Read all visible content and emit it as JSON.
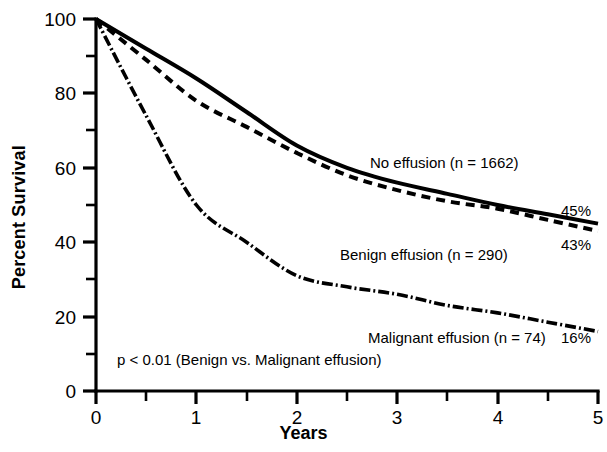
{
  "chart_data": {
    "type": "line",
    "title": "",
    "xlabel": "Years",
    "ylabel": "Percent Survival",
    "xlim": [
      0,
      5
    ],
    "ylim": [
      0,
      100
    ],
    "x_ticks": [
      "0",
      "1",
      "2",
      "3",
      "4",
      "5"
    ],
    "x_tick_values": [
      0,
      1,
      2,
      3,
      4,
      5
    ],
    "x_minor_ticks": [
      0.5,
      1.5,
      2.5,
      3.5,
      4.5
    ],
    "y_ticks": [
      "0",
      "20",
      "40",
      "60",
      "80",
      "100"
    ],
    "y_tick_values": [
      0,
      20,
      40,
      60,
      80,
      100
    ],
    "y_minor_ticks": [
      10,
      30,
      50,
      70,
      90
    ],
    "grid": false,
    "legend_position": "inline-annotations",
    "x": [
      0,
      0.5,
      1,
      1.5,
      2,
      2.5,
      3,
      3.5,
      4,
      4.5,
      5
    ],
    "series": [
      {
        "name": "No effusion (n = 1662)",
        "n": 1662,
        "style": "solid",
        "end_value_label": "45%",
        "values": [
          100,
          92,
          84,
          75,
          66,
          60,
          56,
          53,
          50,
          47.5,
          45
        ]
      },
      {
        "name": "Benign effusion (n = 290)",
        "n": 290,
        "style": "dashed",
        "end_value_label": "43%",
        "values": [
          100,
          89,
          78,
          71,
          64,
          58,
          54,
          51,
          49,
          46,
          43
        ]
      },
      {
        "name": "Malignant effusion (n = 74)",
        "n": 74,
        "style": "dash-dot",
        "end_value_label": "16%",
        "values": [
          100,
          74,
          50,
          40,
          31,
          28,
          26,
          23,
          21,
          18.5,
          16
        ]
      }
    ],
    "annotations": [
      {
        "name": "p-value-note",
        "text": "p < 0.01 (Benign vs. Malignant effusion)"
      }
    ]
  },
  "labels": {
    "series_no_effusion": "No effusion (n = 1662)",
    "series_benign": "Benign effusion (n = 290)",
    "series_malignant": "Malignant effusion (n = 74)",
    "end_no_effusion": "45%",
    "end_benign": "43%",
    "end_malignant": "16%",
    "pvalue": "p < 0.01 (Benign vs. Malignant effusion)",
    "x_title": "Years",
    "y_title": "Percent Survival"
  },
  "axis": {
    "y_0": "0",
    "y_20": "20",
    "y_40": "40",
    "y_60": "60",
    "y_80": "80",
    "y_100": "100",
    "x_0": "0",
    "x_1": "1",
    "x_2": "2",
    "x_3": "3",
    "x_4": "4",
    "x_5": "5"
  },
  "colors": {
    "ink": "#000000",
    "background": "#ffffff"
  }
}
